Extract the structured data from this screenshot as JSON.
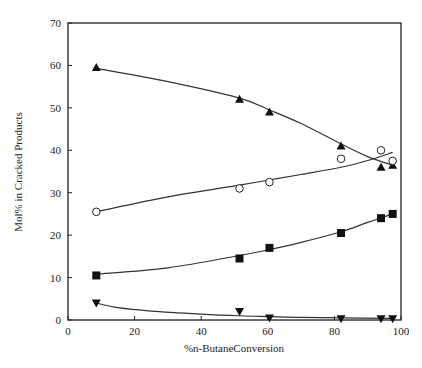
{
  "chart_data": {
    "type": "scatter",
    "title": "",
    "xlabel": "%n-ButaneConversion",
    "ylabel": "Mol% in Cracked Products",
    "xlim": [
      0,
      100
    ],
    "ylim": [
      0,
      70
    ],
    "xticks": [
      0,
      20,
      40,
      60,
      80,
      100
    ],
    "yticks": [
      0,
      10,
      20,
      30,
      40,
      50,
      60,
      70
    ],
    "grid": false,
    "legend": "none",
    "series": [
      {
        "name": "filled-triangle-up",
        "marker": "triangle-up-filled",
        "x": [
          8.5,
          51.5,
          60.5,
          82,
          94,
          97.5
        ],
        "y": [
          59.5,
          52,
          49,
          41,
          36,
          36.5
        ],
        "fit": [
          [
            8.5,
            59.3
          ],
          [
            30,
            56.2
          ],
          [
            51.5,
            52.3
          ],
          [
            60.5,
            49.5
          ],
          [
            70,
            46.3
          ],
          [
            82,
            41.5
          ],
          [
            90,
            38.5
          ],
          [
            97.5,
            36.5
          ]
        ]
      },
      {
        "name": "open-circle",
        "marker": "circle-open",
        "x": [
          8.5,
          51.5,
          60.5,
          82,
          94,
          97.5
        ],
        "y": [
          25.5,
          31,
          32.5,
          38,
          40,
          37.5
        ],
        "fit": [
          [
            8.5,
            25.5
          ],
          [
            30,
            29.0
          ],
          [
            51.5,
            31.8
          ],
          [
            60.5,
            33.0
          ],
          [
            70,
            34.3
          ],
          [
            82,
            36.0
          ],
          [
            90,
            37.6
          ],
          [
            97.5,
            39.5
          ]
        ]
      },
      {
        "name": "filled-square",
        "marker": "square-filled",
        "x": [
          8.5,
          51.5,
          60.5,
          82,
          94,
          97.5
        ],
        "y": [
          10.5,
          14.5,
          17,
          20.5,
          24,
          25
        ],
        "fit": [
          [
            8.5,
            10.8
          ],
          [
            30,
            12.3
          ],
          [
            51.5,
            15.2
          ],
          [
            60.5,
            16.6
          ],
          [
            70,
            18.3
          ],
          [
            82,
            20.8
          ],
          [
            90,
            23.0
          ],
          [
            97.5,
            25.0
          ]
        ]
      },
      {
        "name": "filled-triangle-down",
        "marker": "triangle-down-filled",
        "x": [
          8.5,
          51.5,
          60.5,
          82,
          94,
          97.5
        ],
        "y": [
          4,
          2,
          0.5,
          0.3,
          0.3,
          0.3
        ],
        "fit": [
          [
            8.5,
            4.0
          ],
          [
            15,
            2.9
          ],
          [
            25,
            2.1
          ],
          [
            40,
            1.4
          ],
          [
            51.5,
            1.0
          ],
          [
            60.5,
            0.8
          ],
          [
            70,
            0.6
          ],
          [
            82,
            0.5
          ],
          [
            97.5,
            0.4
          ]
        ]
      }
    ]
  }
}
